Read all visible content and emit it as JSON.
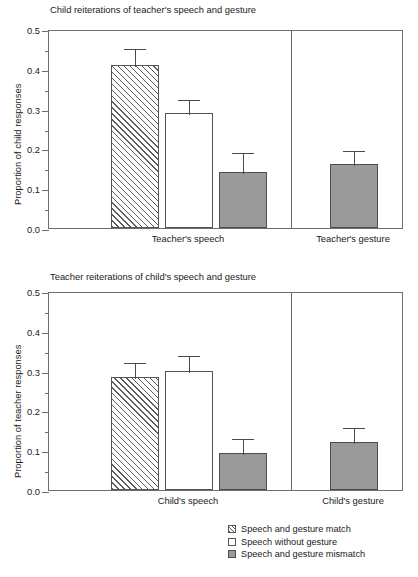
{
  "chart_data": [
    {
      "type": "bar",
      "panel_id": "top",
      "title": "Child reiterations of teacher's speech and gesture",
      "xlabel": "",
      "ylabel": "Proportion of child responses",
      "ylim": [
        0.0,
        0.5
      ],
      "ytick_labels": [
        "0.0",
        "0.1",
        "0.2",
        "0.3",
        "0.4",
        "0.5"
      ],
      "ytick_values": [
        0.0,
        0.1,
        0.2,
        0.3,
        0.4,
        0.5
      ],
      "yminor_values": [
        0.05,
        0.15,
        0.25,
        0.35,
        0.45
      ],
      "grid": false,
      "legend_position": "below-right",
      "groups": [
        {
          "category": "Teacher's speech",
          "bars": [
            {
              "series": "Speech and gesture match",
              "style": "hatch",
              "value": 0.41,
              "err_high": 0.455,
              "err_low": 0.365
            },
            {
              "series": "Speech without gesture",
              "style": "open",
              "value": 0.29,
              "err_high": 0.327,
              "err_low": 0.253
            },
            {
              "series": "Speech and gesture mismatch",
              "style": "solid",
              "value": 0.14,
              "err_high": 0.193,
              "err_low": 0.087
            }
          ]
        },
        {
          "category": "Teacher's gesture",
          "bars": [
            {
              "series": "Speech and gesture mismatch",
              "style": "solid",
              "value": 0.16,
              "err_high": 0.198,
              "err_low": 0.122
            }
          ]
        }
      ]
    },
    {
      "type": "bar",
      "panel_id": "bottom",
      "title": "Teacher reiterations of child's speech and gesture",
      "xlabel": "",
      "ylabel": "Proportion of teacher responses",
      "ylim": [
        0.0,
        0.5
      ],
      "ytick_labels": [
        "0.0",
        "0.1",
        "0.2",
        "0.3",
        "0.4",
        "0.5"
      ],
      "ytick_values": [
        0.0,
        0.1,
        0.2,
        0.3,
        0.4,
        0.5
      ],
      "yminor_values": [
        0.05,
        0.15,
        0.25,
        0.35,
        0.45
      ],
      "grid": false,
      "legend_position": "below-right",
      "groups": [
        {
          "category": "Child's speech",
          "bars": [
            {
              "series": "Speech and gesture match",
              "style": "hatch",
              "value": 0.285,
              "err_high": 0.325,
              "err_low": 0.245
            },
            {
              "series": "Speech without gesture",
              "style": "open",
              "value": 0.3,
              "err_high": 0.342,
              "err_low": 0.258
            },
            {
              "series": "Speech and gesture mismatch",
              "style": "solid",
              "value": 0.093,
              "err_high": 0.133,
              "err_low": 0.053
            }
          ]
        },
        {
          "category": "Child's gesture",
          "bars": [
            {
              "series": "Speech and gesture mismatch",
              "style": "solid",
              "value": 0.12,
              "err_high": 0.16,
              "err_low": 0.08
            }
          ]
        }
      ]
    }
  ],
  "legend": {
    "items": [
      {
        "style": "hatch",
        "label": "Speech and gesture match"
      },
      {
        "style": "open",
        "label": "Speech without gesture"
      },
      {
        "style": "solid",
        "label": "Speech and gesture mismatch"
      }
    ]
  },
  "colors": {
    "solid_fill": "#9a9a9a",
    "bar_outline": "#555555",
    "frame": "#6e6e6e",
    "text": "#1a1a1a"
  }
}
